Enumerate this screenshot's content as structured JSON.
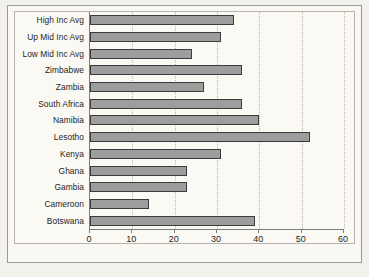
{
  "chart_data": {
    "type": "bar",
    "orientation": "horizontal",
    "title": "",
    "xlabel": "",
    "ylabel": "",
    "xlim": [
      0,
      60
    ],
    "xticks": [
      0,
      10,
      20,
      30,
      40,
      50,
      60
    ],
    "grid": true,
    "legend": false,
    "bar_color": "#9d9d9d",
    "bar_edge_color": "#3c3c3c",
    "background_color": "#fbf9f4",
    "categories": [
      "High Inc Avg",
      "Up Mid Inc Avg",
      "Low Mid Inc Avg",
      "Zimbabwe",
      "Zambia",
      "South Africa",
      "Namibia",
      "Lesotho",
      "Kenya",
      "Ghana",
      "Gambia",
      "Cameroon",
      "Botswana"
    ],
    "values": [
      34,
      31,
      24,
      36,
      27,
      36,
      40,
      52,
      31,
      23,
      23,
      14,
      39
    ]
  }
}
